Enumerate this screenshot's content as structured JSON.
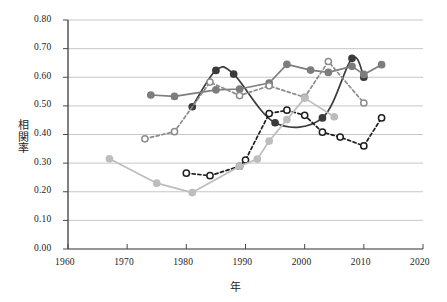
{
  "chart_data": {
    "type": "line",
    "title": "",
    "subtitle": "",
    "xlabel": "年",
    "ylabel": "相関率",
    "xlim": [
      1960,
      2020
    ],
    "ylim": [
      0.0,
      0.8
    ],
    "xticks": [
      1960,
      1970,
      1980,
      1990,
      2000,
      2010,
      2020
    ],
    "xtick_labels": [
      "1960",
      "1970",
      "1980",
      "1990",
      "2000",
      "2010",
      "2020"
    ],
    "yticks": [
      0.0,
      0.1,
      0.2,
      0.3,
      0.4,
      0.5,
      0.6,
      0.7,
      0.8
    ],
    "ytick_labels": [
      "0.00",
      "0.10",
      "0.20",
      "0.30",
      "0.40",
      "0.50",
      "0.60",
      "0.70",
      "0.80"
    ],
    "grid": "horizontal",
    "legend": "none",
    "series": [
      {
        "name": "series-dark-solid",
        "color": "#3b3b3b",
        "linestyle": "solid",
        "marker": "filled-circle",
        "smooth": true,
        "x": [
          1981,
          1985,
          1988,
          1995,
          2003,
          2008,
          2010
        ],
        "y": [
          0.497,
          0.624,
          0.611,
          0.441,
          0.458,
          0.666,
          0.6
        ]
      },
      {
        "name": "series-medium-gray-solid",
        "color": "#7d7d7d",
        "linestyle": "solid",
        "marker": "filled-circle",
        "smooth": false,
        "x": [
          1974,
          1978,
          1985,
          1989,
          1994,
          1997,
          2001,
          2004,
          2008,
          2010,
          2013
        ],
        "y": [
          0.538,
          0.533,
          0.556,
          0.559,
          0.58,
          0.645,
          0.625,
          0.617,
          0.638,
          0.61,
          0.644
        ]
      },
      {
        "name": "series-gray-dashed-open",
        "color": "#8c8c8c",
        "linestyle": "dashed",
        "marker": "open-circle",
        "smooth": false,
        "x": [
          1973,
          1978,
          1984,
          1989,
          1994,
          2000,
          2004,
          2010
        ],
        "y": [
          0.385,
          0.41,
          0.583,
          0.536,
          0.57,
          0.53,
          0.655,
          0.51
        ]
      },
      {
        "name": "series-black-dashed-open",
        "color": "#1f1f1f",
        "linestyle": "dashed",
        "marker": "open-circle",
        "smooth": false,
        "x": [
          1980,
          1984,
          1989,
          1990,
          1994,
          1997,
          2000,
          2003,
          2006,
          2010,
          2013
        ],
        "y": [
          0.265,
          0.256,
          0.289,
          0.311,
          0.473,
          0.485,
          0.467,
          0.408,
          0.391,
          0.36,
          0.458
        ]
      },
      {
        "name": "series-light-gray-solid",
        "color": "#bdbdbd",
        "linestyle": "solid",
        "marker": "filled-circle",
        "smooth": false,
        "x": [
          1967,
          1975,
          1981,
          1989,
          1992,
          1994,
          1997,
          2000,
          2005
        ],
        "y": [
          0.315,
          0.23,
          0.197,
          0.289,
          0.314,
          0.377,
          0.452,
          0.527,
          0.462
        ]
      }
    ]
  },
  "axis": {
    "x_title": "年",
    "y_title": "相関率"
  }
}
